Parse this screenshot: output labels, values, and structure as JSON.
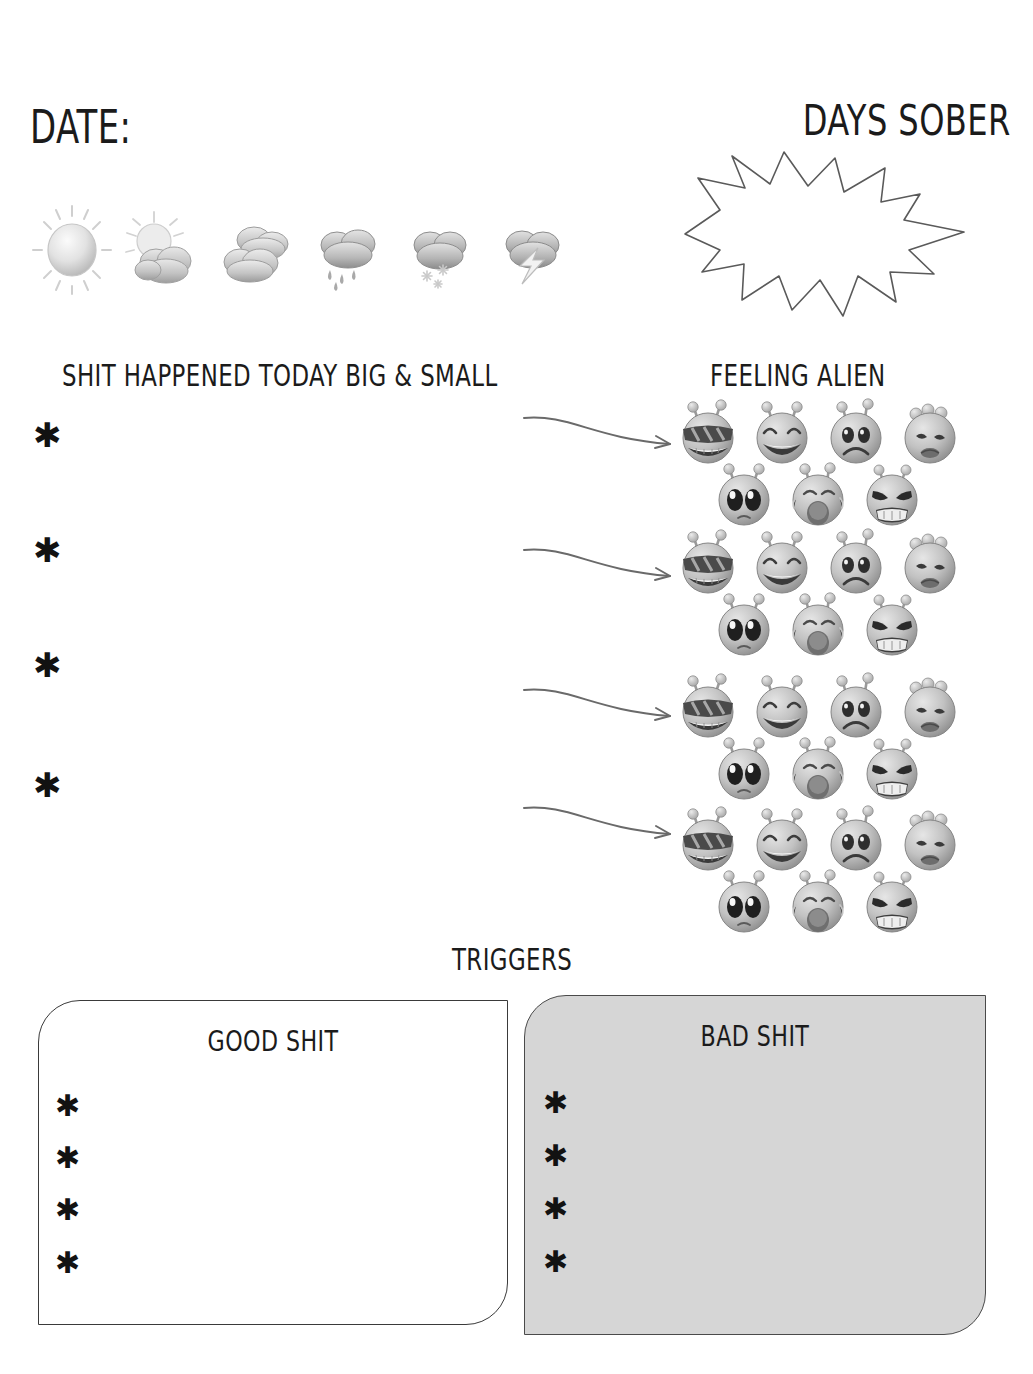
{
  "page": {
    "type": "sobriety-journal-worksheet",
    "background_color": "#ffffff",
    "ink_color": "#1b1b1b"
  },
  "header": {
    "date_label": "Date:",
    "days_sober_label": "Days Sober",
    "days_sober_value": "",
    "burst_shape": "starburst-outline"
  },
  "weather": {
    "icons": [
      {
        "name": "sunny-icon",
        "label": "Sunny"
      },
      {
        "name": "partly-cloudy-icon",
        "label": "Partly Cloudy"
      },
      {
        "name": "cloudy-icon",
        "label": "Cloudy"
      },
      {
        "name": "rain-icon",
        "label": "Rain"
      },
      {
        "name": "snow-icon",
        "label": "Snow"
      },
      {
        "name": "thunderstorm-icon",
        "label": "Thunderstorm"
      }
    ]
  },
  "events": {
    "title": "Shit Happened Today Big & Small",
    "bullet_glyph": "✱",
    "entries": [
      "",
      "",
      "",
      ""
    ]
  },
  "moods": {
    "title": "Feeling alien",
    "faces": [
      {
        "name": "alien-cool-icon",
        "label": "Cool"
      },
      {
        "name": "alien-happy-icon",
        "label": "Happy"
      },
      {
        "name": "alien-sad-icon",
        "label": "Sad"
      },
      {
        "name": "alien-sick-icon",
        "label": "Sick"
      },
      {
        "name": "alien-crying-icon",
        "label": "Crying"
      },
      {
        "name": "alien-wailing-icon",
        "label": "Wailing"
      },
      {
        "name": "alien-angry-icon",
        "label": "Angry"
      }
    ],
    "group_count": 4,
    "arrow_glyph": "curved-arrow-icon"
  },
  "triggers": {
    "title": "Triggers",
    "good": {
      "title": "Good shit",
      "bullet_glyph": "✱",
      "entries": [
        "",
        "",
        "",
        ""
      ],
      "fill_color": "#ffffff"
    },
    "bad": {
      "title": "Bad Shit",
      "bullet_glyph": "✱",
      "entries": [
        "",
        "",
        "",
        ""
      ],
      "fill_color": "#d6d6d6"
    }
  }
}
